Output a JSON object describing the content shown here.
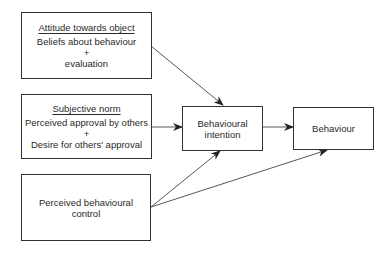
{
  "diagram": {
    "type": "flow",
    "nodes": [
      {
        "id": "attitude",
        "heading": "Attitude towards object",
        "lines": [
          "Beliefs about behaviour",
          "+",
          "evaluation"
        ]
      },
      {
        "id": "subjective_norm",
        "heading": "Subjective norm",
        "lines": [
          "Perceived approval by others",
          "+",
          "Desire for others' approval"
        ]
      },
      {
        "id": "perceived_control",
        "heading": "",
        "lines": [
          "Perceived behavioural",
          "control"
        ]
      },
      {
        "id": "intention",
        "heading": "",
        "lines": [
          "Behavioural",
          "intention"
        ]
      },
      {
        "id": "behaviour",
        "heading": "",
        "lines": [
          "Behaviour"
        ]
      }
    ],
    "edges": [
      {
        "from": "attitude",
        "to": "intention"
      },
      {
        "from": "subjective_norm",
        "to": "intention"
      },
      {
        "from": "perceived_control",
        "to": "intention"
      },
      {
        "from": "intention",
        "to": "behaviour"
      },
      {
        "from": "perceived_control",
        "to": "behaviour"
      }
    ],
    "colors": {
      "stroke": "#333333",
      "text": "#2a2a2a",
      "background": "#ffffff"
    }
  }
}
